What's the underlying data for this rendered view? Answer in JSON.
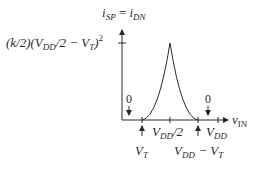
{
  "diagram": {
    "type": "transfer-current-plot",
    "y_axis": {
      "label_main": "i",
      "label_sub1": "SP",
      "label_eq": " = ",
      "label_main2": "i",
      "label_sub2": "DN"
    },
    "x_axis": {
      "label_main": "v",
      "label_sub": "IN"
    },
    "peak_label": {
      "p1": "(k/2)(V",
      "s1": "DD",
      "p2": "/2 − V",
      "s2": "T",
      "p3": ")",
      "sup": "2"
    },
    "zero_left": "0",
    "zero_right": "0",
    "ticks": {
      "vt": {
        "main": "V",
        "sub": "T"
      },
      "vdd_half": {
        "main": "V",
        "sub": "DD",
        "rest": "/2"
      },
      "vdd_minus_vt": {
        "main": "V",
        "sub": "DD",
        "mid": " − V",
        "sub2": "T"
      },
      "vdd": {
        "main": "V",
        "sub": "DD"
      }
    },
    "colors": {
      "line": "#2a2a2a",
      "background": "#ffffff"
    }
  }
}
